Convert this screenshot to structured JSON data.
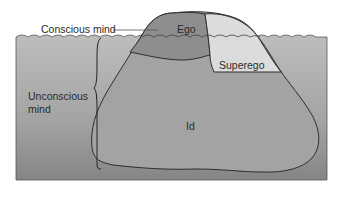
{
  "diagram": {
    "type": "iceberg-model",
    "labels": {
      "conscious": "Conscious mind",
      "unconscious_line1": "Unconscious",
      "unconscious_line2": "mind",
      "ego": "Ego",
      "superego": "Superego",
      "id": "Id"
    },
    "colors": {
      "water_top": "#b9b9b9",
      "water_bottom": "#8a8a8a",
      "ego": "#8e8e8e",
      "superego": "#dedede",
      "id": "#a4a4a4",
      "outline": "#333333"
    }
  }
}
